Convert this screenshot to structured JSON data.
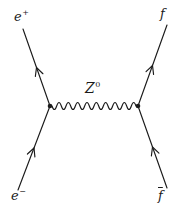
{
  "diagram": {
    "type": "feynman-diagram",
    "background_color": "#ffffff",
    "line_color": "#1b1b1b",
    "labels": {
      "positron": {
        "base": "e",
        "sup": "+"
      },
      "electron": {
        "base": "e",
        "sup": "−"
      },
      "fermion": {
        "base": "f"
      },
      "antifermion": {
        "base": "f"
      },
      "z_boson": {
        "base": "Z",
        "sup": "0"
      }
    }
  }
}
